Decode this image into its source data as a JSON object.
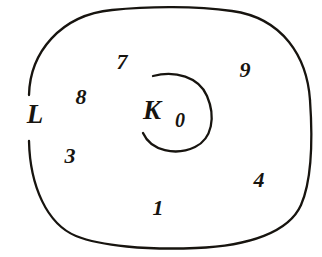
{
  "figure": {
    "kind": "venn-set-diagram",
    "background_color": "#ffffff",
    "stroke_color": "#17140f",
    "text_color": "#17140f",
    "width": 322,
    "height": 257
  },
  "sets": [
    {
      "id": "outer",
      "label": "L",
      "shape": "rounded-square",
      "label_x": 35,
      "label_y": 114,
      "gap_side": "left"
    },
    {
      "id": "inner",
      "label": "K",
      "shape": "circle",
      "label_x": 152,
      "label_y": 110,
      "gap_side": "upper-left"
    }
  ],
  "elements": [
    {
      "label": "7",
      "x": 122,
      "y": 62,
      "region": "L-only",
      "size": "normal"
    },
    {
      "label": "9",
      "x": 245,
      "y": 70,
      "region": "L-only",
      "size": "normal"
    },
    {
      "label": "8",
      "x": 81,
      "y": 97,
      "region": "L-only",
      "size": "normal"
    },
    {
      "label": "0",
      "x": 180,
      "y": 120,
      "region": "K",
      "size": "small"
    },
    {
      "label": "3",
      "x": 70,
      "y": 156,
      "region": "L-only",
      "size": "normal"
    },
    {
      "label": "4",
      "x": 259,
      "y": 180,
      "region": "L-only",
      "size": "normal"
    },
    {
      "label": "1",
      "x": 158,
      "y": 208,
      "region": "L-only",
      "size": "normal"
    }
  ]
}
